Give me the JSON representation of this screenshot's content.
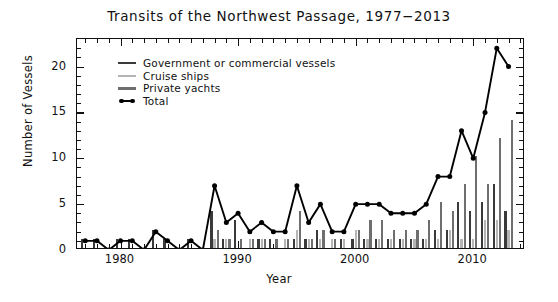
{
  "chart_data": {
    "type": "bar",
    "title": "Transits of the Northwest Passage, 1977−2013",
    "xlabel": "Year",
    "ylabel": "Number of Vessels",
    "xlim": [
      1976.3,
      1976.3
    ],
    "ylim": [
      0,
      23
    ],
    "grid": false,
    "legend_position": "upper-left-inside",
    "x": [
      1977,
      1978,
      1979,
      1980,
      1981,
      1982,
      1983,
      1984,
      1985,
      1986,
      1987,
      1988,
      1989,
      1990,
      1991,
      1992,
      1993,
      1994,
      1995,
      1996,
      1997,
      1998,
      1999,
      2000,
      2001,
      2002,
      2003,
      2004,
      2005,
      2006,
      2007,
      2008,
      2009,
      2010,
      2011,
      2012,
      2013
    ],
    "xticks": [
      1980,
      1990,
      2000,
      2010
    ],
    "xtick_labels": [
      "1980",
      "1990",
      "2000",
      "2010"
    ],
    "yticks": [
      0,
      5,
      10,
      15,
      20
    ],
    "ytick_labels": [
      "0",
      "5",
      "10",
      "15",
      "20"
    ],
    "yticks_minor": [
      1,
      2,
      3,
      4,
      6,
      7,
      8,
      9,
      11,
      12,
      13,
      14,
      16,
      17,
      18,
      19,
      21,
      22
    ],
    "series": [
      {
        "name": "Government or commercial vessels",
        "color": "#3a3a3a",
        "values": [
          1,
          1,
          0,
          1,
          1,
          0,
          2,
          1,
          0,
          1,
          0,
          4,
          1,
          3,
          0,
          1,
          1,
          0,
          1,
          1,
          2,
          0,
          1,
          1,
          1,
          1,
          1,
          1,
          1,
          1,
          2,
          2,
          5,
          4,
          5,
          7,
          4
        ]
      },
      {
        "name": "Cruise ships",
        "color": "#b5b5b5",
        "values": [
          0,
          0,
          0,
          0,
          0,
          0,
          0,
          0,
          0,
          0,
          0,
          1,
          1,
          0,
          1,
          1,
          0,
          1,
          2,
          1,
          1,
          1,
          1,
          2,
          1,
          1,
          1,
          1,
          1,
          1,
          1,
          2,
          1,
          1,
          3,
          3,
          2
        ]
      },
      {
        "name": "Private yachts",
        "color": "#6e6e6e",
        "values": [
          0,
          0,
          0,
          0,
          0,
          0,
          0,
          0,
          0,
          0,
          0,
          2,
          1,
          1,
          1,
          1,
          1,
          1,
          4,
          1,
          2,
          1,
          0,
          2,
          3,
          3,
          2,
          2,
          2,
          3,
          5,
          4,
          7,
          10,
          7,
          12,
          14
        ]
      },
      {
        "name": "Total",
        "color": "#000000",
        "marker": "circle",
        "values": [
          1,
          1,
          0,
          1,
          1,
          0,
          2,
          1,
          0,
          1,
          0,
          7,
          3,
          4,
          2,
          3,
          2,
          2,
          7,
          3,
          5,
          2,
          2,
          5,
          5,
          5,
          4,
          4,
          4,
          5,
          8,
          8,
          13,
          10,
          15,
          22,
          20
        ]
      }
    ]
  },
  "legend": {
    "items": [
      {
        "label": "Government or commercial vessels",
        "swatch": "line",
        "color": "#3a3a3a"
      },
      {
        "label": "Cruise ships",
        "swatch": "line",
        "color": "#b5b5b5"
      },
      {
        "label": "Private yachts",
        "swatch": "line",
        "color": "#6e6e6e"
      },
      {
        "label": "Total",
        "swatch": "line-marker",
        "color": "#000000"
      }
    ]
  }
}
